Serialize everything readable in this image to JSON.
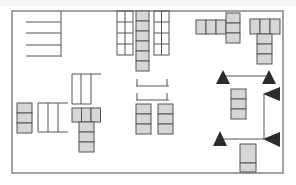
{
  "diagram": {
    "title": "",
    "colors": {
      "background": "#ffffff",
      "border": "#666666",
      "line": "#555555",
      "cell_fill": "#d6d6d6",
      "cell_stroke": "#555555",
      "triangle": "#2b2b2b"
    },
    "frame": {
      "x": 12,
      "y": 11,
      "w": 271,
      "h": 162
    },
    "lines": [
      {
        "id": "stall-divider-vertical",
        "x1": 61,
        "y1": 11,
        "x2": 61,
        "y2": 57
      },
      {
        "id": "stall-line-1",
        "x1": 26,
        "y1": 22,
        "x2": 61,
        "y2": 22
      },
      {
        "id": "stall-line-2",
        "x1": 26,
        "y1": 33,
        "x2": 61,
        "y2": 33
      },
      {
        "id": "stall-line-3",
        "x1": 26,
        "y1": 45,
        "x2": 61,
        "y2": 45
      },
      {
        "id": "stall-line-4",
        "x1": 26,
        "y1": 56,
        "x2": 61,
        "y2": 56
      },
      {
        "id": "bike-rack-1-bar",
        "x1": 136,
        "y1": 86,
        "x2": 169,
        "y2": 86
      },
      {
        "id": "bike-rack-1-post-l",
        "x1": 137,
        "y1": 79,
        "x2": 137,
        "y2": 86
      },
      {
        "id": "bike-rack-1-post-r",
        "x1": 167,
        "y1": 79,
        "x2": 167,
        "y2": 86
      },
      {
        "id": "bike-rack-2-bar",
        "x1": 136,
        "y1": 100,
        "x2": 169,
        "y2": 100
      },
      {
        "id": "bike-rack-2-post-l",
        "x1": 137,
        "y1": 93,
        "x2": 137,
        "y2": 100
      },
      {
        "id": "bike-rack-2-post-r",
        "x1": 167,
        "y1": 93,
        "x2": 167,
        "y2": 100
      },
      {
        "id": "open-grid-top",
        "x1": 38,
        "y1": 103,
        "x2": 68,
        "y2": 103
      },
      {
        "id": "open-grid-bottom",
        "x1": 38,
        "y1": 132,
        "x2": 68,
        "y2": 132
      },
      {
        "id": "open-grid-v1",
        "x1": 38,
        "y1": 103,
        "x2": 38,
        "y2": 132
      },
      {
        "id": "open-grid-v2",
        "x1": 48,
        "y1": 103,
        "x2": 48,
        "y2": 132
      },
      {
        "id": "open-grid-v3",
        "x1": 58,
        "y1": 103,
        "x2": 58,
        "y2": 132
      },
      {
        "id": "upper-grid-top",
        "x1": 72,
        "y1": 74,
        "x2": 101,
        "y2": 74
      },
      {
        "id": "upper-grid-v1",
        "x1": 72,
        "y1": 74,
        "x2": 72,
        "y2": 104
      },
      {
        "id": "upper-grid-v2",
        "x1": 81,
        "y1": 74,
        "x2": 81,
        "y2": 104
      },
      {
        "id": "upper-grid-v3",
        "x1": 91,
        "y1": 74,
        "x2": 91,
        "y2": 104
      },
      {
        "id": "upper-grid-bottom",
        "x1": 72,
        "y1": 104,
        "x2": 91,
        "y2": 104
      },
      {
        "id": "gate-top-bar",
        "x1": 223,
        "y1": 76,
        "x2": 269,
        "y2": 76
      },
      {
        "id": "gate-vertical",
        "x1": 264,
        "y1": 94,
        "x2": 264,
        "y2": 139
      },
      {
        "id": "gate-bottom-bar",
        "x1": 221,
        "y1": 139,
        "x2": 264,
        "y2": 139
      }
    ],
    "open_grids": [
      {
        "id": "shelf-grid-left",
        "x": 117,
        "y": 11,
        "w": 16,
        "h": 44,
        "cols": 2,
        "rows": 4
      },
      {
        "id": "shelf-grid-right",
        "x": 154,
        "y": 11,
        "w": 15,
        "h": 44,
        "cols": 2,
        "rows": 4
      }
    ],
    "cell_groups": [
      {
        "id": "column-center-top",
        "x": 136,
        "y": 11,
        "cw": 13,
        "ch": 10,
        "cols": 1,
        "rows": 6
      },
      {
        "id": "row-top-right-a",
        "x": 196,
        "y": 20,
        "cw": 10,
        "ch": 14,
        "cols": 3,
        "rows": 1
      },
      {
        "id": "column-top-right-a",
        "x": 226,
        "y": 13,
        "cw": 14,
        "ch": 10,
        "cols": 1,
        "rows": 3
      },
      {
        "id": "row-top-right-b",
        "x": 250,
        "y": 19,
        "cw": 10,
        "ch": 15,
        "cols": 3,
        "rows": 1
      },
      {
        "id": "column-top-right-b",
        "x": 257,
        "y": 34,
        "cw": 15,
        "ch": 10,
        "cols": 1,
        "rows": 3
      },
      {
        "id": "column-left-bottom",
        "x": 17,
        "y": 103,
        "cw": 15,
        "ch": 10,
        "cols": 1,
        "rows": 3
      },
      {
        "id": "row-center-left",
        "x": 72,
        "y": 108,
        "cw": 9.5,
        "ch": 14,
        "cols": 3,
        "rows": 1
      },
      {
        "id": "column-center-left",
        "x": 79,
        "y": 122,
        "cw": 15,
        "ch": 10,
        "cols": 1,
        "rows": 3
      },
      {
        "id": "column-center-a",
        "x": 136,
        "y": 104,
        "cw": 15,
        "ch": 10,
        "cols": 1,
        "rows": 3
      },
      {
        "id": "column-center-b",
        "x": 158,
        "y": 104,
        "cw": 15,
        "ch": 10,
        "cols": 1,
        "rows": 3
      },
      {
        "id": "column-right-mid",
        "x": 231,
        "y": 89,
        "cw": 15,
        "ch": 10,
        "cols": 1,
        "rows": 3
      },
      {
        "id": "box-right-bottom",
        "x": 240,
        "y": 144,
        "cw": 16,
        "ch": 19,
        "cols": 1,
        "rows": 1
      },
      {
        "id": "box-right-bottom-lower",
        "x": 240,
        "y": 163,
        "cw": 16,
        "ch": 9,
        "cols": 1,
        "rows": 1
      }
    ],
    "triangles": [
      {
        "id": "arrow-up-1",
        "points": "216,84 223,70 230,84"
      },
      {
        "id": "arrow-up-2",
        "points": "262,84 269,70 276,84"
      },
      {
        "id": "arrow-left-1",
        "points": "263,94 280,87 280,101"
      },
      {
        "id": "arrow-up-3",
        "points": "213,146 220,131 227,146"
      },
      {
        "id": "arrow-left-2",
        "points": "263,139 280,132 280,147"
      }
    ]
  }
}
